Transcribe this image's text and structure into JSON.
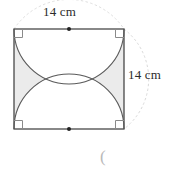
{
  "figure": {
    "kind": "geometry-diagram",
    "labels": {
      "top_side": "14 cm",
      "right_side": "14 cm"
    },
    "stray_text": "(",
    "colors": {
      "outline": "#3a3a3a",
      "arc": "#5a5a5a",
      "shading": "#ebebeb",
      "guide_arc": "#d8d8d8",
      "text": "#2b2b2b",
      "background": "#ffffff"
    },
    "geometry": {
      "square": {
        "x": 14,
        "y": 29,
        "size": 110
      },
      "side_length_value": 14,
      "side_length_unit": "cm",
      "semicircle_radius": 55,
      "midpoint_dots": [
        {
          "x": 69,
          "y": 29
        },
        {
          "x": 69,
          "y": 129
        }
      ],
      "right_angle_marks": 4
    }
  }
}
